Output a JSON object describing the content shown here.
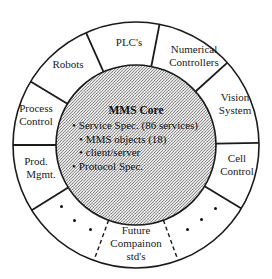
{
  "diagram": {
    "core": {
      "title": "MMS Core",
      "items": [
        {
          "text": "Service Spec. (86 services)",
          "level": 0
        },
        {
          "text": "MMS objects (18)",
          "level": 1
        },
        {
          "text": "client/server",
          "level": 1
        },
        {
          "text": "Protocol Spec.",
          "level": 0
        }
      ],
      "fill": "#c9c9c9"
    },
    "ring_segments": [
      {
        "id": "plcs",
        "lines": [
          "PLC's"
        ]
      },
      {
        "id": "numerical-controllers",
        "lines": [
          "Numerical",
          "Controllers"
        ]
      },
      {
        "id": "vision-system",
        "lines": [
          "Vision",
          "System"
        ]
      },
      {
        "id": "cell-control",
        "lines": [
          "Cell",
          "Control"
        ]
      },
      {
        "id": "placeholder-right",
        "lines": [
          "·  ·  ·"
        ]
      },
      {
        "id": "future-companion-stds",
        "lines": [
          "Future",
          "Compainon",
          "std's"
        ]
      },
      {
        "id": "placeholder-left",
        "lines": [
          "·  ·  ·"
        ]
      },
      {
        "id": "prod-mgmt",
        "lines": [
          "Prod.",
          "Mgmt."
        ]
      },
      {
        "id": "process-control",
        "lines": [
          "Process",
          "Control"
        ]
      },
      {
        "id": "robots",
        "lines": [
          "Robots"
        ]
      }
    ],
    "colors": {
      "line": "#1a1a1a",
      "background": "#ffffff"
    }
  }
}
